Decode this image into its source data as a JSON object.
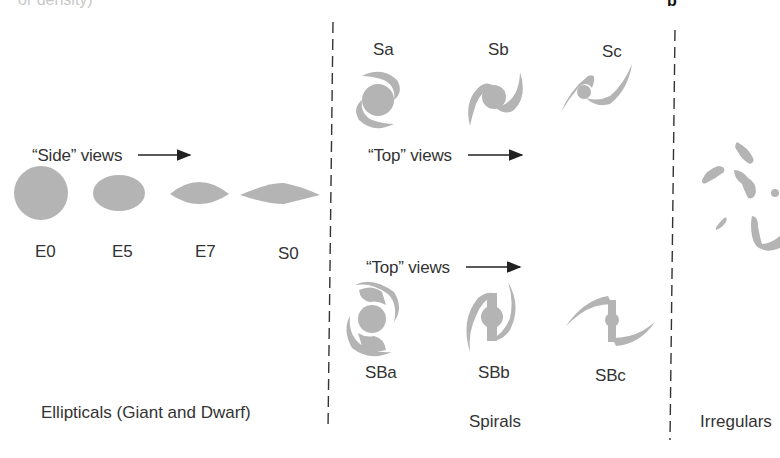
{
  "figure": {
    "top_cut_text": "or density)",
    "panel_letter": "b",
    "shape_color": "#b4b4b4",
    "line_color": "#333333"
  },
  "ellipticals": {
    "side_views_label": "“Side” views",
    "types": [
      {
        "label": "E0"
      },
      {
        "label": "E5"
      },
      {
        "label": "E7"
      },
      {
        "label": "S0"
      }
    ],
    "caption": "Ellipticals (Giant and Dwarf)"
  },
  "spirals": {
    "normal": {
      "types": [
        {
          "label": "Sa"
        },
        {
          "label": "Sb"
        },
        {
          "label": "Sc"
        }
      ],
      "top_views_label": "“Top” views"
    },
    "barred": {
      "types": [
        {
          "label": "SBa"
        },
        {
          "label": "SBb"
        },
        {
          "label": "SBc"
        }
      ],
      "top_views_label": "“Top” views"
    },
    "caption": "Spirals"
  },
  "irregulars": {
    "caption": "Irregulars"
  }
}
